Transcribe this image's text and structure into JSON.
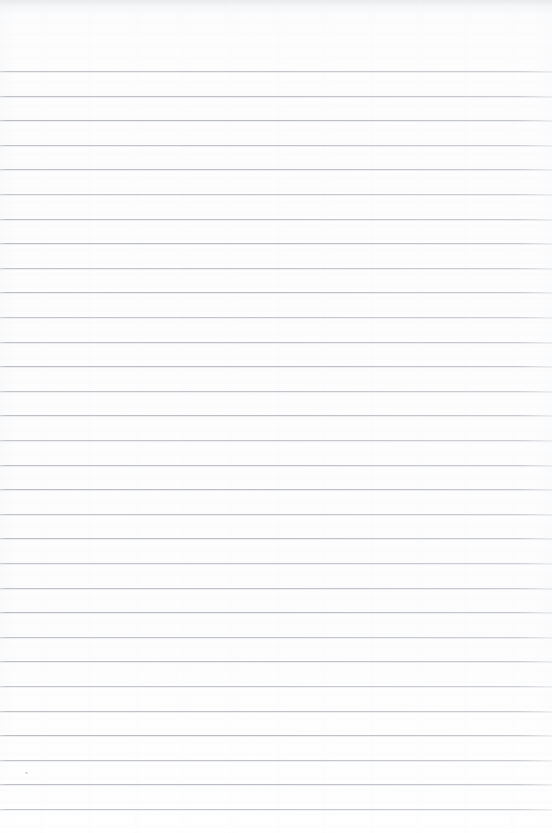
{
  "document": {
    "kind": "scanned-lined-paper",
    "title": "Blank ruled notebook page",
    "written_content": "",
    "page_width": 552,
    "page_height": 833
  },
  "colors": {
    "page_background": "#fdfdfe",
    "rule_line": "#bac0c5",
    "rule_line_shadow": "#ced2d6",
    "top_scan_shade": "#e4e6e9"
  },
  "ruling": {
    "style": "horizontal-ruled",
    "line_count": 31,
    "first_line_y": 71,
    "line_spacing": 24.6,
    "line_thickness": 1,
    "left_margin_rule": false,
    "header_space_px": 71,
    "footer_space_px": 24,
    "line_y_positions": [
      71,
      95.6,
      120.2,
      144.8,
      169.4,
      194,
      218.6,
      243.2,
      267.8,
      292.4,
      317,
      341.6,
      366.2,
      390.8,
      415.4,
      440,
      464.6,
      489.2,
      513.8,
      538.4,
      563,
      587.6,
      612.2,
      636.8,
      661.4,
      686,
      710.6,
      735.2,
      759.8,
      784.4,
      809
    ]
  },
  "artifacts": {
    "top_scan_shadow_height": 12,
    "specks": [
      {
        "x": 25,
        "y": 772
      }
    ]
  }
}
